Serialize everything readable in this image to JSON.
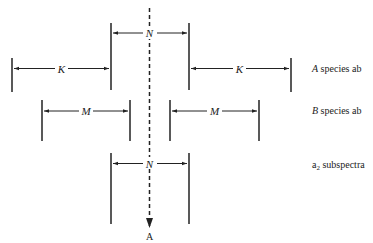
{
  "diagram": {
    "type": "spectral-coupling-diagram",
    "axis": {
      "label": "A",
      "style": "dashed-arrow-down"
    },
    "rows": [
      {
        "id": "n-top",
        "spacing_label": "N",
        "row_label": ""
      },
      {
        "id": "a-species",
        "spacing_label": "K",
        "row_label_italic": "A",
        "row_label_rest": " species ab"
      },
      {
        "id": "b-species",
        "spacing_label": "M",
        "row_label_italic": "B",
        "row_label_rest": " species ab"
      },
      {
        "id": "a2-subspectra",
        "spacing_label": "N",
        "row_label_main": "a",
        "row_label_sub": "2",
        "row_label_rest": " subspectra"
      }
    ],
    "labels": {
      "n_top": "N",
      "k_left": "K",
      "k_right": "K",
      "m_left": "M",
      "m_right": "M",
      "n_bottom": "N",
      "axis": "A",
      "a_species_var": "A",
      "a_species_text": " species ab",
      "b_species_var": "B",
      "b_species_text": " species ab",
      "a2_main": "a",
      "a2_sub": "2",
      "a2_text": " subspectra"
    },
    "colors": {
      "line": "#222222",
      "background": "#ffffff"
    }
  }
}
